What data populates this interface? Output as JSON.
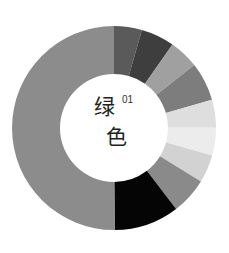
{
  "chart_data": {
    "type": "pie",
    "subtype": "donut",
    "title_superscript": "01",
    "start_angle_deg": 0,
    "direction": "clockwise",
    "center": [
      114,
      128
    ],
    "outer_radius": 102,
    "inner_radius": 54,
    "legend": "none",
    "slices": [
      {
        "label": "",
        "value": 4.4,
        "color": "#5a5a5a"
      },
      {
        "label": "",
        "value": 5.3,
        "color": "#3e3e3e"
      },
      {
        "label": "",
        "value": 4.7,
        "color": "#a0a0a0"
      },
      {
        "label": "",
        "value": 6.1,
        "color": "#7d7d7d"
      },
      {
        "label": "",
        "value": 4.4,
        "color": "#dedede"
      },
      {
        "label": "",
        "value": 4.4,
        "color": "#ececec"
      },
      {
        "label": "",
        "value": 4.4,
        "color": "#d2d2d2"
      },
      {
        "label": "",
        "value": 5.8,
        "color": "#8a8a8a"
      },
      {
        "label": "",
        "value": 10.3,
        "color": "#050505"
      },
      {
        "label": "",
        "value": 50.0,
        "color": "#8c8c8c"
      }
    ]
  },
  "center_label": {
    "line1": "绿",
    "line2": "色",
    "superscript": "01"
  }
}
